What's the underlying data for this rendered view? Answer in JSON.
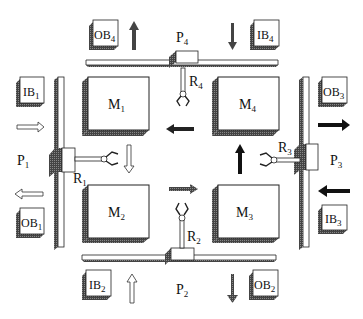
{
  "diagram": {
    "type": "robotic-cell-layout",
    "machines": [
      {
        "id": "M1",
        "label": "M",
        "sub": "1"
      },
      {
        "id": "M2",
        "label": "M",
        "sub": "2"
      },
      {
        "id": "M3",
        "label": "M",
        "sub": "3"
      },
      {
        "id": "M4",
        "label": "M",
        "sub": "4"
      }
    ],
    "robots": [
      {
        "id": "R1",
        "label": "R",
        "sub": "1"
      },
      {
        "id": "R2",
        "label": "R",
        "sub": "2"
      },
      {
        "id": "R3",
        "label": "R",
        "sub": "3"
      },
      {
        "id": "R4",
        "label": "R",
        "sub": "4"
      }
    ],
    "tracks": [
      {
        "id": "P1",
        "label": "P",
        "sub": "1"
      },
      {
        "id": "P2",
        "label": "P",
        "sub": "2"
      },
      {
        "id": "P3",
        "label": "P",
        "sub": "3"
      },
      {
        "id": "P4",
        "label": "P",
        "sub": "4"
      }
    ],
    "input_buffers": [
      {
        "id": "IB1",
        "label": "IB",
        "sub": "1"
      },
      {
        "id": "IB2",
        "label": "IB",
        "sub": "2"
      },
      {
        "id": "IB3",
        "label": "IB",
        "sub": "3"
      },
      {
        "id": "IB4",
        "label": "IB",
        "sub": "4"
      }
    ],
    "output_buffers": [
      {
        "id": "OB1",
        "label": "OB",
        "sub": "1"
      },
      {
        "id": "OB2",
        "label": "OB",
        "sub": "2"
      },
      {
        "id": "OB3",
        "label": "OB",
        "sub": "3"
      },
      {
        "id": "OB4",
        "label": "OB",
        "sub": "4"
      }
    ],
    "colors": {
      "stroke": "#222222",
      "shadow": "#555555",
      "fill": "#ffffff",
      "solid_arrow": "#111111"
    }
  }
}
